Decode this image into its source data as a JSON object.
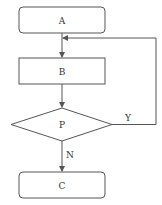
{
  "diagram": {
    "type": "flowchart",
    "colors": {
      "stroke": "#555555",
      "text": "#333333",
      "background": "#ffffff"
    },
    "nodes": [
      {
        "id": "A",
        "label": "A",
        "shape": "rounded-rectangle"
      },
      {
        "id": "B",
        "label": "B",
        "shape": "rectangle"
      },
      {
        "id": "P",
        "label": "P",
        "shape": "diamond"
      },
      {
        "id": "C",
        "label": "C",
        "shape": "rounded-rectangle"
      }
    ],
    "edges": [
      {
        "from": "A",
        "to": "B",
        "label": ""
      },
      {
        "from": "B",
        "to": "P",
        "label": ""
      },
      {
        "from": "P",
        "to": "B",
        "label": "Y"
      },
      {
        "from": "P",
        "to": "C",
        "label": "N"
      }
    ]
  }
}
